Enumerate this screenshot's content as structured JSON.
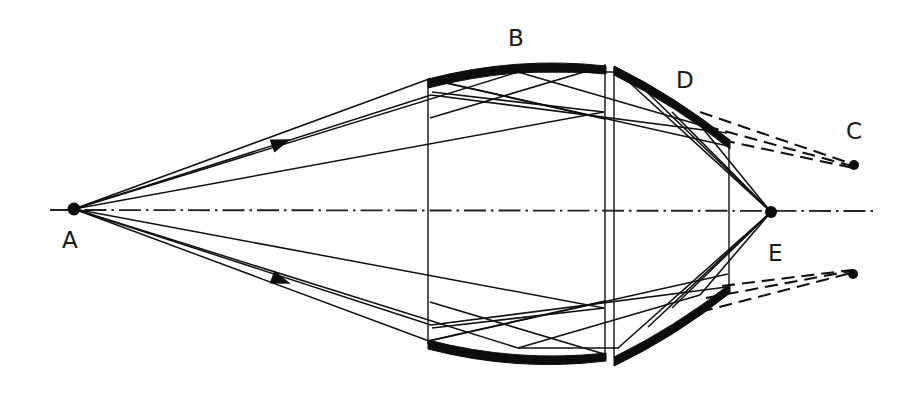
{
  "figure": {
    "type": "optical-ray-diagram",
    "title": "",
    "background_color": "#ffffff",
    "ink_color": "#111111",
    "width": 914,
    "height": 396
  },
  "labels": [
    {
      "id": "A",
      "text": "A",
      "x": 62,
      "y": 248,
      "meaning": "object-point-on-axis"
    },
    {
      "id": "B",
      "text": "B",
      "x": 508,
      "y": 46,
      "meaning": "primary-curved-mirror"
    },
    {
      "id": "C",
      "text": "C",
      "x": 846,
      "y": 139,
      "meaning": "upper-virtual-image-point"
    },
    {
      "id": "D",
      "text": "D",
      "x": 676,
      "y": 88,
      "meaning": "upper-secondary-mirror"
    },
    {
      "id": "E",
      "text": "E",
      "x": 768,
      "y": 261,
      "meaning": "lower-secondary-mirror"
    }
  ],
  "points": [
    {
      "id": "A",
      "x": 74,
      "y": 209,
      "r": 6.5,
      "meaning": "source-point"
    },
    {
      "id": "focus",
      "x": 771,
      "y": 212,
      "r": 6.0,
      "meaning": "axial-focus-point"
    },
    {
      "id": "C",
      "x": 854,
      "y": 165,
      "r": 5.0,
      "meaning": "upper-image-point"
    },
    {
      "id": "E",
      "x": 853,
      "y": 274,
      "r": 5.0,
      "meaning": "lower-image-point"
    }
  ],
  "optical_axis": {
    "style": "dash-dot",
    "y": 210,
    "x_start": 50,
    "x_end": 878
  },
  "mirrors": {
    "B_upper_arc": {
      "x_start": 428,
      "x_end": 606,
      "y_edge": 78,
      "y_apex": 61,
      "thickness": 9
    },
    "B_lower_arc": {
      "x_start": 428,
      "x_end": 606,
      "y_edge": 340,
      "y_apex": 358,
      "thickness": 9
    },
    "D_band": {
      "x_start": 614,
      "y_start": 67,
      "x_end": 730,
      "y_end": 144,
      "thickness": 8
    },
    "E_band": {
      "x_start": 614,
      "y_start": 357,
      "x_end": 730,
      "y_end": 290,
      "thickness": 8
    }
  },
  "verticals": [
    {
      "x": 428,
      "y1": 78,
      "y2": 344
    },
    {
      "x": 605,
      "y1": 64,
      "y2": 356
    },
    {
      "x": 614,
      "y1": 67,
      "y2": 357
    },
    {
      "x": 729,
      "y1": 144,
      "y2": 291
    }
  ],
  "arrow_markers": [
    {
      "x": 272,
      "y": 146,
      "angle": -22,
      "meaning": "ray-direction-upper"
    },
    {
      "x": 272,
      "y": 277,
      "angle": 22,
      "meaning": "ray-direction-lower"
    }
  ],
  "ray_counts": {
    "solid_rays": 22,
    "dashed_virtual_rays": 6
  },
  "notes": {
    "description": "Cassegrain-style reflecting optical system ray trace",
    "dashed_meaning": "virtual-ray-extensions"
  }
}
